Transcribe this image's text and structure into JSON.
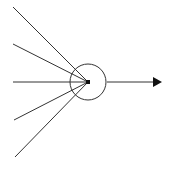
{
  "diagram": {
    "type": "perceptron-neuron",
    "background": "#ffffff",
    "stroke_color": "#333333",
    "node": {
      "cx": 88,
      "cy": 82,
      "r": 18
    },
    "junction": {
      "x": 86,
      "y": 80,
      "size": 4
    },
    "inputs": [
      {
        "x1": 13,
        "y1": 7
      },
      {
        "x1": 13,
        "y1": 44
      },
      {
        "x1": 13,
        "y1": 82
      },
      {
        "x1": 14,
        "y1": 120
      },
      {
        "x1": 15,
        "y1": 157
      }
    ],
    "output": {
      "x1": 107,
      "y1": 82,
      "x2": 162,
      "y2": 82
    }
  }
}
